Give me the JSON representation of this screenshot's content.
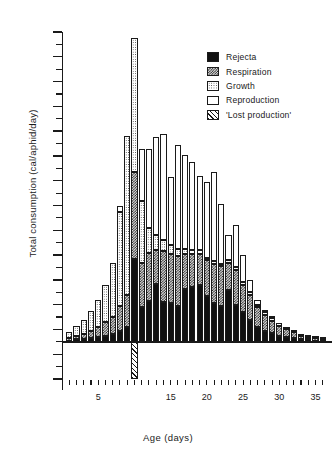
{
  "chart_data": {
    "type": "bar",
    "title": "",
    "subtitle": "",
    "xlabel": "Age (days)",
    "ylabel": "Total consumption (cal/aphid/day)",
    "stacked": true,
    "grid": false,
    "legend_position": "top-right",
    "xlim": [
      0,
      37
    ],
    "ylim": [
      -0.3,
      2.5
    ],
    "y_major_ticks": [
      2.5,
      2.3,
      2.1,
      1.9,
      1.7,
      1.5,
      1.3,
      1.1,
      0.9,
      0.7,
      0.5,
      0.3,
      0.1,
      -0.1,
      -0.3
    ],
    "y_major_tick_labels": [
      "2·5",
      "2·3",
      "2·1",
      "1·9",
      "1·7",
      "1·5",
      "1·3",
      "1·1",
      "0·9",
      "0·7",
      "0·5",
      "0·3",
      "0·1",
      "-0·1",
      "-0·3"
    ],
    "y_minor_tick_step": 0.1,
    "x_tick_step": 1,
    "x_tick_labels": [
      "5",
      "15",
      "20",
      "25",
      "30",
      "35"
    ],
    "x_tick_label_values": [
      5,
      15,
      20,
      25,
      30,
      35
    ],
    "x": [
      1,
      2,
      3,
      4,
      5,
      6,
      7,
      8,
      9,
      10,
      11,
      12,
      13,
      14,
      15,
      16,
      17,
      18,
      19,
      20,
      21,
      22,
      23,
      24,
      25,
      26,
      27,
      28,
      29,
      30,
      31,
      32,
      33,
      34,
      35,
      36
    ],
    "series": [
      {
        "name": "Rejecta",
        "fill": "solid-black",
        "color": "#111111",
        "values": [
          0.01,
          0.02,
          0.02,
          0.03,
          0.04,
          0.05,
          0.06,
          0.09,
          0.12,
          0.67,
          0.28,
          0.33,
          0.47,
          0.32,
          0.31,
          0.29,
          0.43,
          0.44,
          0.46,
          0.37,
          0.31,
          0.29,
          0.42,
          0.3,
          0.24,
          0.18,
          0.12,
          0.09,
          0.07,
          0.05,
          0.04,
          0.03,
          0.02,
          0.02,
          0.01,
          0.01
        ]
      },
      {
        "name": "Respiration",
        "fill": "checker-dark",
        "color": "#d9d9d9",
        "values": [
          0.02,
          0.03,
          0.04,
          0.06,
          0.08,
          0.11,
          0.14,
          0.2,
          0.26,
          0.7,
          0.36,
          0.39,
          0.27,
          0.41,
          0.4,
          0.4,
          0.28,
          0.27,
          0.25,
          0.29,
          0.32,
          0.32,
          0.22,
          0.28,
          0.22,
          0.2,
          0.16,
          0.13,
          0.1,
          0.08,
          0.06,
          0.05,
          0.03,
          0.02,
          0.02,
          0.01
        ]
      },
      {
        "name": "Growth",
        "fill": "dotted-light",
        "color": "#ffffff",
        "values": [
          0.05,
          0.08,
          0.12,
          0.16,
          0.22,
          0.3,
          0.44,
          0.76,
          1.28,
          1.08,
          0.5,
          0.2,
          0.12,
          0.09,
          0.07,
          0.06,
          0.04,
          0.03,
          0.03,
          0.02,
          0.02,
          0.02,
          0.02,
          0.02,
          0.02,
          0.02,
          0.02,
          0.02,
          0.02,
          0.02,
          0.02,
          0.01,
          0.01,
          0.01,
          0.01,
          0.01
        ]
      },
      {
        "name": "Reproduction",
        "fill": "white",
        "color": "#ffffff",
        "values": [
          0.0,
          0.0,
          0.0,
          0.0,
          0.0,
          0.0,
          0.0,
          0.05,
          0.0,
          0.0,
          0.42,
          0.64,
          0.79,
          0.86,
          0.55,
          0.84,
          0.76,
          0.71,
          0.6,
          0.61,
          0.72,
          0.48,
          0.2,
          0.34,
          0.22,
          0.1,
          0.04,
          0.02,
          0.01,
          0.0,
          0.0,
          0.0,
          0.0,
          0.0,
          0.0,
          0.0
        ]
      }
    ],
    "lost_production": {
      "name": "'Lost production'",
      "fill": "diagonal-hatch",
      "x": 10,
      "from": 0.0,
      "to": -0.3
    }
  },
  "legend": {
    "items": [
      {
        "label": "Rejecta",
        "swatch": "solid-black"
      },
      {
        "label": "Respiration",
        "swatch": "checker-dark"
      },
      {
        "label": "Growth",
        "swatch": "dotted-light"
      },
      {
        "label": "Reproduction",
        "swatch": "white"
      },
      {
        "label": "'Lost production'",
        "swatch": "diagonal-hatch"
      }
    ]
  }
}
